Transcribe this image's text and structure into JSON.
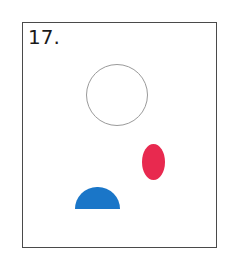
{
  "figure": {
    "label": "17.",
    "shapes": [
      {
        "name": "outline-circle",
        "fill": "none",
        "stroke": "#9a9a9a"
      },
      {
        "name": "red-ellipse",
        "fill": "#e8294f"
      },
      {
        "name": "blue-half-disc",
        "fill": "#1a76c8"
      }
    ]
  }
}
